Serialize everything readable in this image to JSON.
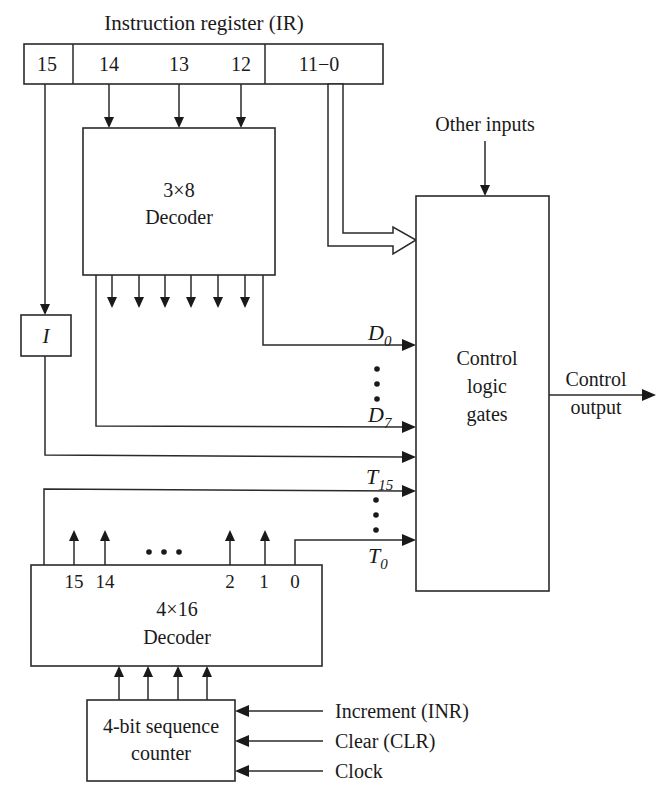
{
  "diagram": {
    "title": "Instruction register (IR)",
    "ir_fields": [
      "15",
      "14",
      "13",
      "12",
      "11−0"
    ],
    "decoder_3x8": {
      "line1": "3×8",
      "line2": "Decoder"
    },
    "i_flipflop": "I",
    "control_logic": {
      "line1": "Control",
      "line2": "logic",
      "line3": "gates"
    },
    "other_inputs": "Other inputs",
    "control_output": {
      "line1": "Control",
      "line2": "output"
    },
    "signals": {
      "d0": {
        "base": "D",
        "sub": "0"
      },
      "d7": {
        "base": "D",
        "sub": "7"
      },
      "t15": {
        "base": "T",
        "sub": "15"
      },
      "t0": {
        "base": "T",
        "sub": "0"
      }
    },
    "decoder_4x16": {
      "line1": "4×16",
      "line2": "Decoder",
      "outputs": [
        "15",
        "14",
        "2",
        "1",
        "0"
      ],
      "ellipsis": "• • •"
    },
    "sequence_counter": {
      "line1": "4-bit sequence",
      "line2": "counter"
    },
    "counter_inputs": [
      "Increment (INR)",
      "Clear (CLR)",
      "Clock"
    ],
    "colors": {
      "stroke": "#2a2a2a",
      "text": "#1a1a1a",
      "background": "#ffffff"
    }
  }
}
